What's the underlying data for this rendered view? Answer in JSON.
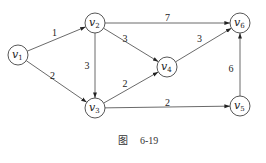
{
  "caption": {
    "fig": "图",
    "number": "6-19"
  },
  "nodes": [
    {
      "id": "v1",
      "base": "v",
      "sub": "1"
    },
    {
      "id": "v2",
      "base": "v",
      "sub": "2"
    },
    {
      "id": "v3",
      "base": "v",
      "sub": "3"
    },
    {
      "id": "v4",
      "base": "v",
      "sub": "4"
    },
    {
      "id": "v5",
      "base": "v",
      "sub": "5"
    },
    {
      "id": "v6",
      "base": "v",
      "sub": "6"
    }
  ],
  "edges": [
    {
      "from": "v1",
      "to": "v2",
      "weight": "1"
    },
    {
      "from": "v1",
      "to": "v3",
      "weight": "2"
    },
    {
      "from": "v2",
      "to": "v3",
      "weight": "3"
    },
    {
      "from": "v2",
      "to": "v4",
      "weight": "3"
    },
    {
      "from": "v2",
      "to": "v6",
      "weight": "7"
    },
    {
      "from": "v3",
      "to": "v4",
      "weight": "2"
    },
    {
      "from": "v3",
      "to": "v5",
      "weight": "2"
    },
    {
      "from": "v4",
      "to": "v6",
      "weight": "3"
    },
    {
      "from": "v5",
      "to": "v6",
      "weight": "6"
    }
  ]
}
